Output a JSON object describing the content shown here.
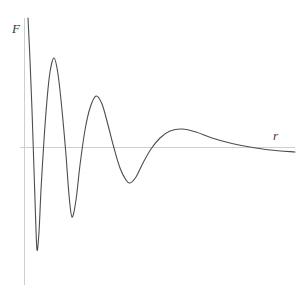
{
  "figure": {
    "width": 303,
    "height": 292,
    "background_color": "#ffffff"
  },
  "axes": {
    "y_axis_label": "F",
    "x_axis_label": "r",
    "axis_color": "#cfcfcf",
    "y_axis": {
      "x": 24.5,
      "y_top": 18,
      "y_bottom": 285
    },
    "x_axis": {
      "y": 147.5,
      "x_left": 20,
      "x_right": 295
    },
    "origin_px": {
      "x": 24.5,
      "y": 147.5
    },
    "ticks": [],
    "grid": false
  },
  "curve": {
    "color": "#4d4d4d",
    "stroke_width": 1.1,
    "description": "damped oscillation"
  },
  "chart_data": {
    "type": "line",
    "title": "",
    "subtitle": "",
    "xlabel": "r",
    "ylabel": "F",
    "grid": false,
    "legend": [],
    "axis_units": "arbitrary",
    "xlim": [
      0,
      10
    ],
    "ylim": [
      -1.15,
      1.0
    ],
    "series": [
      {
        "name": "F(r)",
        "color": "#4d4d4d",
        "form": "damped oscillation, decaying amplitude, increasing period",
        "points_px": [
          [
            28,
            18
          ],
          [
            30,
            60
          ],
          [
            32,
            110
          ],
          [
            34,
            170
          ],
          [
            35.5,
            215
          ],
          [
            37,
            250
          ],
          [
            39,
            232
          ],
          [
            41,
            190
          ],
          [
            44,
            140
          ],
          [
            47,
            100
          ],
          [
            50,
            72
          ],
          [
            54,
            58
          ],
          [
            58,
            74
          ],
          [
            62,
            110
          ],
          [
            66,
            155
          ],
          [
            69,
            195
          ],
          [
            72,
            217
          ],
          [
            76,
            200
          ],
          [
            80,
            165
          ],
          [
            85,
            130
          ],
          [
            90,
            108
          ],
          [
            96,
            96
          ],
          [
            102,
            104
          ],
          [
            108,
            125
          ],
          [
            114,
            148
          ],
          [
            120,
            168
          ],
          [
            126,
            180
          ],
          [
            130,
            183
          ],
          [
            136,
            177
          ],
          [
            143,
            163
          ],
          [
            151,
            149
          ],
          [
            160,
            138
          ],
          [
            170,
            131
          ],
          [
            182,
            129
          ],
          [
            196,
            132
          ],
          [
            212,
            138
          ],
          [
            230,
            143
          ],
          [
            250,
            147
          ],
          [
            270,
            150
          ],
          [
            295,
            152
          ]
        ],
        "key_features": [
          {
            "label": "start",
            "x_px": 28,
            "y_px": 18,
            "type": "endpoint"
          },
          {
            "label": "trough-1",
            "x_px": 37,
            "y_px": 250,
            "type": "minimum"
          },
          {
            "label": "peak-1",
            "x_px": 54,
            "y_px": 58,
            "type": "maximum"
          },
          {
            "label": "trough-2",
            "x_px": 72,
            "y_px": 217,
            "type": "minimum"
          },
          {
            "label": "peak-2",
            "x_px": 96,
            "y_px": 96,
            "type": "maximum"
          },
          {
            "label": "trough-3",
            "x_px": 130,
            "y_px": 183,
            "type": "minimum"
          },
          {
            "label": "peak-3",
            "x_px": 182,
            "y_px": 129,
            "type": "maximum"
          },
          {
            "label": "end",
            "x_px": 295,
            "y_px": 152,
            "type": "endpoint"
          }
        ],
        "values_normalized": {
          "note": "y=0 at axis line (y_px 147.5); positive is up",
          "extrema": [
            {
              "feature": "trough-1",
              "value": -0.74
            },
            {
              "feature": "peak-1",
              "value": 0.64
            },
            {
              "feature": "trough-2",
              "value": -0.5
            },
            {
              "feature": "peak-2",
              "value": 0.37
            },
            {
              "feature": "trough-3",
              "value": -0.26
            },
            {
              "feature": "peak-3",
              "value": 0.13
            },
            {
              "feature": "end",
              "value": -0.03
            }
          ]
        }
      }
    ]
  }
}
